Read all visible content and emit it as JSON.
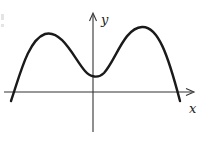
{
  "figure": {
    "axis_labels": {
      "x": "x",
      "y": "y"
    },
    "colors": {
      "curve": "#1a1a1a",
      "axis": "#333333",
      "background": "#ffffff"
    }
  }
}
